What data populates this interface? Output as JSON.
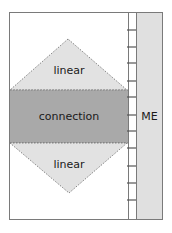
{
  "diagram": {
    "labels": {
      "top_region": "linear",
      "middle_band": "connection",
      "bottom_region": "linear",
      "side_column": "ME"
    },
    "colors": {
      "frame": "#7a7a7a",
      "triangle_fill": "#e2e2e2",
      "band_fill": "#a9a9a9",
      "me_fill": "#e0e0e0",
      "background": "#ffffff",
      "text": "#1a1a1a"
    },
    "ladder_tick_count": 11
  }
}
